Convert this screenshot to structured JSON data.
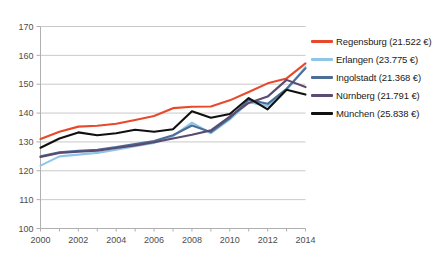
{
  "chart_data": {
    "type": "line",
    "title": "",
    "subtitle": "",
    "xlabel": "",
    "ylabel": "",
    "x": [
      2000,
      2001,
      2002,
      2003,
      2004,
      2005,
      2006,
      2007,
      2008,
      2009,
      2010,
      2011,
      2012,
      2013,
      2014
    ],
    "xlim": [
      2000,
      2014
    ],
    "ylim": [
      100,
      170
    ],
    "yticks": [
      100,
      110,
      120,
      130,
      140,
      150,
      160,
      170
    ],
    "xticks": [
      2000,
      2002,
      2004,
      2006,
      2008,
      2010,
      2012,
      2014
    ],
    "xtick_labels": [
      "2000",
      "2002",
      "2004",
      "2006",
      "2008",
      "2010",
      "2012",
      "2014"
    ],
    "ytick_labels": [
      "100",
      "110",
      "120",
      "130",
      "140",
      "150",
      "160",
      "170"
    ],
    "grid": true,
    "grid_axis": "y",
    "legend_position": "right",
    "series": [
      {
        "name": "Regensburg",
        "label": "Regensburg (21.522 €)",
        "value_text": "21.522 €",
        "color": "#E8492B",
        "values": [
          131.0,
          133.5,
          135.3,
          135.6,
          136.3,
          137.6,
          139.0,
          141.7,
          142.2,
          142.3,
          144.4,
          147.3,
          150.3,
          152.0,
          157.2
        ]
      },
      {
        "name": "Erlangen",
        "label": "Erlangen  (23.775 €)",
        "value_text": "23.775 €",
        "color": "#8FC6E8",
        "values": [
          121.8,
          125.0,
          125.6,
          126.2,
          127.3,
          128.5,
          129.6,
          132.0,
          136.7,
          133.0,
          137.8,
          143.8,
          142.5,
          148.0,
          156.0
        ]
      },
      {
        "name": "Ingolstadt",
        "label": "Ingolstadt (21.368 €)",
        "value_text": "21.368 €",
        "color": "#4A6E96",
        "values": [
          125.0,
          126.4,
          126.9,
          127.3,
          128.2,
          129.3,
          130.3,
          132.3,
          135.7,
          133.4,
          138.2,
          144.6,
          143.2,
          148.4,
          155.5
        ]
      },
      {
        "name": "Nürnberg",
        "label": "Nürnberg  (21.791 €)",
        "value_text": "21.791 €",
        "color": "#5B4A72",
        "values": [
          124.8,
          126.2,
          126.6,
          127.0,
          127.9,
          128.8,
          129.9,
          131.2,
          132.5,
          134.0,
          138.8,
          143.5,
          145.7,
          151.5,
          149.0
        ]
      },
      {
        "name": "München",
        "label": "München (25.838 €)",
        "value_text": "25.838 €",
        "color": "#101010",
        "values": [
          128.0,
          131.2,
          133.3,
          132.3,
          133.0,
          134.2,
          133.5,
          134.4,
          140.6,
          138.4,
          139.7,
          145.2,
          141.3,
          148.1,
          146.4
        ]
      }
    ]
  }
}
